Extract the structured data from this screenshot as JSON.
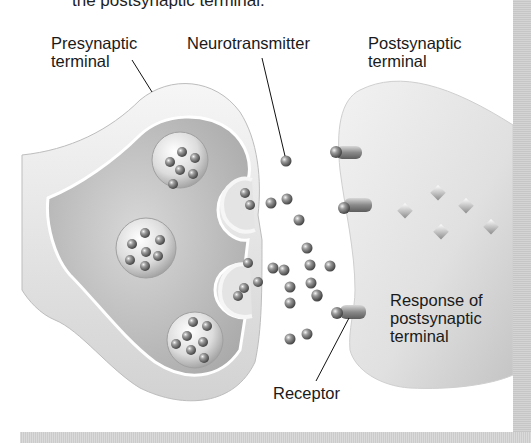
{
  "figure": {
    "caption_fragment": "the postsynaptic terminal.",
    "labels": {
      "presynaptic": [
        "Presynaptic",
        "terminal"
      ],
      "neurotransmitter": "Neurotransmitter",
      "postsynaptic": [
        "Postsynaptic",
        "terminal"
      ],
      "response": [
        "Response of",
        "postsynaptic",
        "terminal"
      ],
      "receptor": "Receptor"
    },
    "colors": {
      "background": "#ffffff",
      "membrane_light": "#f0f0f0",
      "membrane_mid": "#c8c8c8",
      "cytoplasm": "#b8b8b8",
      "molecule": "#6e6e6e",
      "text": "#1a1a1a"
    }
  }
}
